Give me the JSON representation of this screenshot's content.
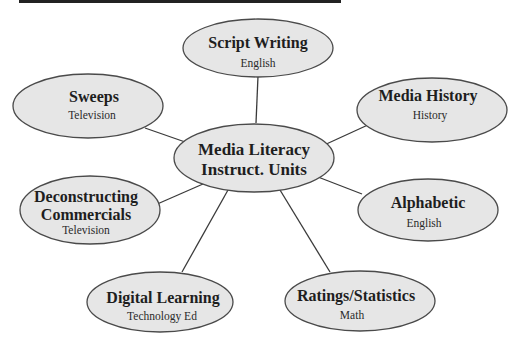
{
  "diagram": {
    "type": "concept-map",
    "colors": {
      "node_fill": "#e6e6e6",
      "node_stroke": "#4a4a4a",
      "connector": "#3a3a3a",
      "top_bar": "#222222"
    },
    "center": {
      "title_line1": "Media Literacy",
      "title_line2": "Instruct. Units"
    },
    "nodes": [
      {
        "id": "script-writing",
        "title": "Script Writing",
        "subject": "English"
      },
      {
        "id": "sweeps",
        "title": "Sweeps",
        "subject": "Television"
      },
      {
        "id": "media-history",
        "title": "Media History",
        "subject": "History"
      },
      {
        "id": "deconstructing-commercials",
        "title_line1": "Deconstructing",
        "title_line2": "Commercials",
        "subject": "Television"
      },
      {
        "id": "alphabetic",
        "title": "Alphabetic",
        "subject": "English"
      },
      {
        "id": "digital-learning",
        "title": "Digital Learning",
        "subject": "Technology Ed"
      },
      {
        "id": "ratings-statistics",
        "title": "Ratings/Statistics",
        "subject": "Math"
      }
    ]
  }
}
